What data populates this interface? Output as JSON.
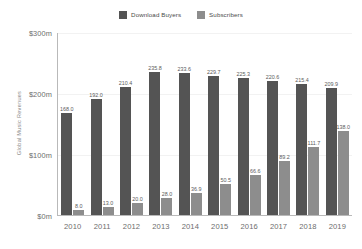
{
  "chart_data": {
    "type": "bar",
    "title": "",
    "xlabel": "",
    "ylabel": "Global Music Revenues",
    "categories": [
      "2010",
      "2011",
      "2012",
      "2013",
      "2014",
      "2015",
      "2016",
      "2017",
      "2018",
      "2019"
    ],
    "series": [
      {
        "name": "Download Buyers",
        "color": "#545454",
        "values": [
          168.0,
          192.0,
          210.4,
          235.8,
          233.6,
          229.7,
          225.3,
          220.6,
          215.4,
          209.9
        ],
        "labels": [
          "168.0",
          "192.0",
          "210.4",
          "235.8",
          "233.6",
          "229.7",
          "225.3",
          "220.6",
          "215.4",
          "209.9"
        ]
      },
      {
        "name": "Subscribers",
        "color": "#8d8d8d",
        "values": [
          8.0,
          13.0,
          20.0,
          28.0,
          36.9,
          50.5,
          66.6,
          89.2,
          111.7,
          138.0
        ],
        "labels": [
          "8.0",
          "13.0",
          "20.0",
          "28.0",
          "36.9",
          "50.5",
          "66.6",
          "89.2",
          "111.7",
          "138.0"
        ]
      }
    ],
    "ylim": [
      0,
      300
    ],
    "yticks": [
      0,
      100,
      200,
      300
    ],
    "ytick_labels": [
      "$0m",
      "$100m",
      "$200m",
      "$300m"
    ],
    "grid": true,
    "grid_color": "#f2f2f2",
    "legend_position": "top-center",
    "axis_color": "#b9b9b9",
    "background": "#ffffff"
  },
  "legend": {
    "entries": [
      {
        "label": "Download Buyers",
        "color": "#545454"
      },
      {
        "label": "Subscribers",
        "color": "#8d8d8d"
      }
    ]
  },
  "axes": {
    "y_title": "Global Music Revenues"
  }
}
